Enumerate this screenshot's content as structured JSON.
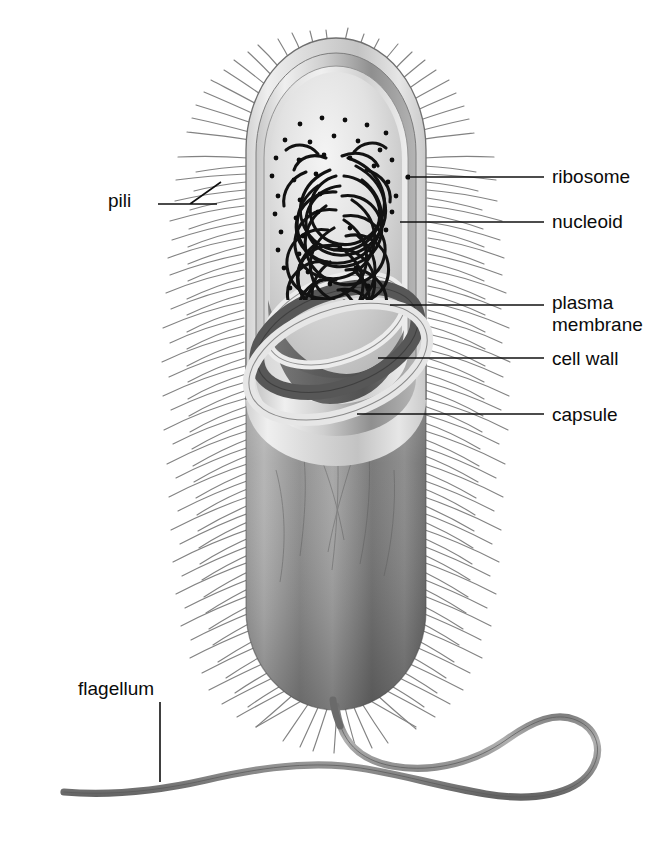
{
  "figure": {
    "background_color": "#ffffff",
    "ink_color": "#101010",
    "width": 670,
    "height": 841
  },
  "labels": {
    "pili": "pili",
    "flagellum": "flagellum",
    "ribosome": "ribosome",
    "nucleoid": "nucleoid",
    "plasma_membrane_line1": "plasma",
    "plasma_membrane_line2": "membrane",
    "cell_wall": "cell wall",
    "capsule": "capsule"
  },
  "label_positions": {
    "pili": {
      "x": 108,
      "y": 202,
      "anchor": "start"
    },
    "flagellum": {
      "x": 78,
      "y": 690,
      "anchor": "start"
    },
    "ribosome": {
      "x": 552,
      "y": 178,
      "anchor": "start"
    },
    "nucleoid": {
      "x": 552,
      "y": 223,
      "anchor": "start"
    },
    "plasma_membrane_line1": {
      "x": 552,
      "y": 304,
      "anchor": "start"
    },
    "plasma_membrane_line2": {
      "x": 552,
      "y": 326,
      "anchor": "start"
    },
    "cell_wall": {
      "x": 552,
      "y": 360,
      "anchor": "start"
    },
    "capsule": {
      "x": 552,
      "y": 416,
      "anchor": "start"
    }
  },
  "leader_lines": {
    "pili": "M 158 204 L 217 204 M 190 204 L 221 182",
    "flagellum": "M 160 702 L 160 782",
    "ribosome": "M 408 177 L 544 177",
    "nucleoid": "M 400 222 L 544 222",
    "plasma_membrane": "M 390 305 L 544 305",
    "cell_wall": "M 378 358 L 544 358",
    "capsule": "M 357 414 L 544 414"
  },
  "structures": {
    "capsule": {
      "name": "capsule",
      "description": "outermost light gray sheath enclosing the cell"
    },
    "cell_wall": {
      "name": "cell wall",
      "description": "mid-gray rigid layer beneath the capsule"
    },
    "plasma_membrane": {
      "name": "plasma membrane",
      "description": "thin innermost boundary of the cytoplasm"
    },
    "cytoplasm": {
      "name": "cytoplasm",
      "description": "pale interior filling of the cell"
    },
    "nucleoid": {
      "name": "nucleoid",
      "description": "dense tangle of looping DNA strands in the cell interior"
    },
    "ribosome": {
      "name": "ribosome",
      "description": "small dark dots scattered through the cytoplasm"
    },
    "pili": {
      "name": "pili",
      "description": "numerous fine hairs radiating from the cell surface"
    },
    "flagellum": {
      "name": "flagellum",
      "description": "single thick wavy tail emerging from the bottom of the cell"
    }
  },
  "counts": {
    "ribosome_dots": 46,
    "pili_hairs": 132,
    "nucleoid_loops": 26
  },
  "colors": {
    "capsule_light": "#e8e8e8",
    "capsule_mid": "#c9c9c9",
    "cell_wall_gray": "#9a9a9a",
    "cell_wall_dark": "#6e6e6e",
    "membrane_gray": "#b5b5b5",
    "cytoplasm_light": "#e4e4e4",
    "body_dark": "#808080",
    "body_deep": "#5f5f5f",
    "nucleoid_black": "#111111",
    "ribosome_black": "#0d0d0d",
    "pili_gray": "#7f7f7f",
    "flagellum_gray": "#8b8b8b",
    "flagellum_edge": "#5d5d5d"
  }
}
